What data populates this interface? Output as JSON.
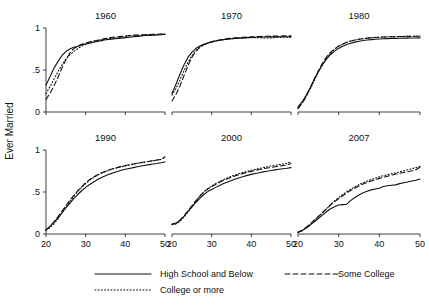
{
  "chart_data": {
    "type": "line",
    "title": "",
    "ylabel": "Ever Married",
    "xlabel": "",
    "xlim": [
      20,
      50
    ],
    "ylim": [
      0,
      1
    ],
    "yticks": [
      "0",
      ".5",
      "1"
    ],
    "ytick_values": [
      0,
      0.5,
      1
    ],
    "xticks": [
      "20",
      "30",
      "40",
      "50"
    ],
    "xtick_values": [
      20,
      30,
      40,
      50
    ],
    "grid": false,
    "legend_position": "bottom",
    "legend": [
      {
        "name": "High School and Below",
        "style": "solid"
      },
      {
        "name": "Some College",
        "style": "dashed"
      },
      {
        "name": "College or more",
        "style": "dotted"
      }
    ],
    "x": [
      20,
      21,
      22,
      23,
      24,
      25,
      26,
      27,
      28,
      29,
      30,
      31,
      32,
      33,
      34,
      35,
      36,
      37,
      38,
      39,
      40,
      41,
      42,
      43,
      44,
      45,
      46,
      47,
      48,
      49,
      50
    ],
    "panels": [
      {
        "title": "1960",
        "series": [
          {
            "name": "High School and Below",
            "style": "solid",
            "values": [
              0.32,
              0.42,
              0.52,
              0.6,
              0.67,
              0.72,
              0.75,
              0.77,
              0.78,
              0.8,
              0.81,
              0.82,
              0.83,
              0.84,
              0.85,
              0.86,
              0.865,
              0.87,
              0.875,
              0.88,
              0.885,
              0.89,
              0.895,
              0.9,
              0.905,
              0.91,
              0.912,
              0.915,
              0.918,
              0.92,
              0.925
            ]
          },
          {
            "name": "Some College",
            "style": "dashed",
            "values": [
              0.15,
              0.22,
              0.31,
              0.41,
              0.52,
              0.62,
              0.7,
              0.755,
              0.785,
              0.805,
              0.82,
              0.835,
              0.845,
              0.855,
              0.865,
              0.875,
              0.885,
              0.89,
              0.895,
              0.9,
              0.905,
              0.91,
              0.915,
              0.915,
              0.918,
              0.92,
              0.922,
              0.925,
              0.925,
              0.928,
              0.93
            ]
          },
          {
            "name": "College or more",
            "style": "dotted",
            "values": [
              0.22,
              0.3,
              0.39,
              0.48,
              0.56,
              0.63,
              0.68,
              0.72,
              0.755,
              0.785,
              0.805,
              0.825,
              0.84,
              0.85,
              0.86,
              0.87,
              0.875,
              0.88,
              0.885,
              0.89,
              0.9,
              0.905,
              0.905,
              0.91,
              0.912,
              0.915,
              0.918,
              0.92,
              0.922,
              0.925,
              0.928
            ]
          }
        ]
      },
      {
        "title": "1970",
        "series": [
          {
            "name": "High School and Below",
            "style": "solid",
            "values": [
              0.22,
              0.33,
              0.45,
              0.56,
              0.65,
              0.71,
              0.755,
              0.785,
              0.805,
              0.82,
              0.835,
              0.845,
              0.855,
              0.862,
              0.868,
              0.872,
              0.876,
              0.88,
              0.883,
              0.886,
              0.888,
              0.89,
              0.89,
              0.892,
              0.892,
              0.894,
              0.894,
              0.895,
              0.895,
              0.896,
              0.897
            ]
          },
          {
            "name": "Some College",
            "style": "dashed",
            "values": [
              0.13,
              0.21,
              0.31,
              0.43,
              0.55,
              0.65,
              0.72,
              0.77,
              0.8,
              0.82,
              0.835,
              0.848,
              0.858,
              0.866,
              0.873,
              0.878,
              0.882,
              0.886,
              0.889,
              0.892,
              0.895,
              0.897,
              0.899,
              0.9,
              0.902,
              0.903,
              0.904,
              0.905,
              0.906,
              0.906,
              0.907
            ]
          },
          {
            "name": "College or more",
            "style": "dotted",
            "values": [
              0.2,
              0.28,
              0.38,
              0.49,
              0.59,
              0.67,
              0.73,
              0.77,
              0.8,
              0.82,
              0.834,
              0.845,
              0.855,
              0.862,
              0.868,
              0.872,
              0.876,
              0.879,
              0.882,
              0.884,
              0.886,
              0.885,
              0.884,
              0.882,
              0.881,
              0.883,
              0.886,
              0.888,
              0.889,
              0.89,
              0.891
            ]
          }
        ]
      },
      {
        "title": "1980",
        "series": [
          {
            "name": "High School and Below",
            "style": "solid",
            "values": [
              0.06,
              0.12,
              0.2,
              0.29,
              0.39,
              0.48,
              0.56,
              0.63,
              0.685,
              0.725,
              0.757,
              0.782,
              0.803,
              0.819,
              0.832,
              0.842,
              0.851,
              0.857,
              0.862,
              0.866,
              0.869,
              0.872,
              0.874,
              0.876,
              0.877,
              0.878,
              0.879,
              0.88,
              0.881,
              0.881,
              0.882
            ]
          },
          {
            "name": "Some College",
            "style": "dashed",
            "values": [
              0.04,
              0.1,
              0.18,
              0.28,
              0.39,
              0.49,
              0.58,
              0.655,
              0.71,
              0.752,
              0.785,
              0.81,
              0.83,
              0.845,
              0.857,
              0.866,
              0.873,
              0.879,
              0.883,
              0.887,
              0.89,
              0.892,
              0.894,
              0.896,
              0.897,
              0.898,
              0.899,
              0.9,
              0.9,
              0.901,
              0.902
            ]
          },
          {
            "name": "College or more",
            "style": "dotted",
            "values": [
              0.05,
              0.11,
              0.185,
              0.275,
              0.375,
              0.475,
              0.565,
              0.64,
              0.7,
              0.745,
              0.78,
              0.807,
              0.828,
              0.844,
              0.856,
              0.866,
              0.873,
              0.879,
              0.884,
              0.888,
              0.891,
              0.893,
              0.895,
              0.897,
              0.898,
              0.899,
              0.9,
              0.901,
              0.902,
              0.902,
              0.903
            ]
          }
        ]
      },
      {
        "title": "1990",
        "series": [
          {
            "name": "High School and Below",
            "style": "solid",
            "values": [
              0.05,
              0.09,
              0.14,
              0.19,
              0.25,
              0.31,
              0.365,
              0.42,
              0.47,
              0.515,
              0.555,
              0.59,
              0.62,
              0.648,
              0.672,
              0.694,
              0.713,
              0.73,
              0.745,
              0.758,
              0.77,
              0.78,
              0.79,
              0.8,
              0.81,
              0.818,
              0.826,
              0.834,
              0.84,
              0.848,
              0.858
            ]
          },
          {
            "name": "Some College",
            "style": "dashed",
            "values": [
              0.05,
              0.09,
              0.145,
              0.205,
              0.27,
              0.335,
              0.4,
              0.46,
              0.515,
              0.565,
              0.61,
              0.648,
              0.68,
              0.706,
              0.728,
              0.748,
              0.765,
              0.78,
              0.793,
              0.805,
              0.815,
              0.825,
              0.834,
              0.843,
              0.851,
              0.859,
              0.866,
              0.873,
              0.88,
              0.888,
              0.92
            ]
          },
          {
            "name": "College or more",
            "style": "dotted",
            "values": [
              0.045,
              0.075,
              0.12,
              0.18,
              0.25,
              0.32,
              0.385,
              0.45,
              0.505,
              0.555,
              0.6,
              0.64,
              0.672,
              0.7,
              0.723,
              0.743,
              0.76,
              0.775,
              0.788,
              0.8,
              0.81,
              0.82,
              0.83,
              0.84,
              0.848,
              0.856,
              0.864,
              0.872,
              0.88,
              0.888,
              0.915
            ]
          }
        ]
      },
      {
        "title": "2000",
        "series": [
          {
            "name": "High School and Below",
            "style": "solid",
            "values": [
              0.12,
              0.13,
              0.165,
              0.21,
              0.265,
              0.32,
              0.375,
              0.425,
              0.47,
              0.505,
              0.53,
              0.555,
              0.578,
              0.6,
              0.62,
              0.638,
              0.655,
              0.67,
              0.685,
              0.698,
              0.71,
              0.72,
              0.73,
              0.74,
              0.748,
              0.756,
              0.763,
              0.77,
              0.776,
              0.782,
              0.79
            ]
          },
          {
            "name": "Some College",
            "style": "dashed",
            "values": [
              0.115,
              0.125,
              0.16,
              0.215,
              0.275,
              0.335,
              0.395,
              0.45,
              0.5,
              0.535,
              0.565,
              0.59,
              0.615,
              0.638,
              0.658,
              0.677,
              0.693,
              0.708,
              0.722,
              0.735,
              0.746,
              0.757,
              0.767,
              0.776,
              0.785,
              0.793,
              0.8,
              0.808,
              0.815,
              0.822,
              0.84
            ]
          },
          {
            "name": "College or more",
            "style": "dotted",
            "values": [
              0.11,
              0.12,
              0.15,
              0.2,
              0.26,
              0.325,
              0.39,
              0.45,
              0.5,
              0.54,
              0.572,
              0.6,
              0.625,
              0.648,
              0.668,
              0.687,
              0.704,
              0.72,
              0.734,
              0.747,
              0.759,
              0.77,
              0.78,
              0.79,
              0.8,
              0.81,
              0.818,
              0.826,
              0.834,
              0.842,
              0.862
            ]
          }
        ]
      },
      {
        "title": "2007",
        "series": [
          {
            "name": "High School and Below",
            "style": "solid",
            "values": [
              0.02,
              0.04,
              0.07,
              0.105,
              0.145,
              0.185,
              0.225,
              0.265,
              0.3,
              0.325,
              0.345,
              0.35,
              0.355,
              0.4,
              0.435,
              0.465,
              0.49,
              0.51,
              0.525,
              0.535,
              0.545,
              0.565,
              0.575,
              0.58,
              0.585,
              0.6,
              0.61,
              0.62,
              0.63,
              0.64,
              0.655
            ]
          },
          {
            "name": "Some College",
            "style": "dashed",
            "values": [
              0.02,
              0.045,
              0.08,
              0.12,
              0.165,
              0.21,
              0.255,
              0.3,
              0.345,
              0.385,
              0.42,
              0.455,
              0.49,
              0.52,
              0.548,
              0.572,
              0.595,
              0.615,
              0.632,
              0.648,
              0.662,
              0.675,
              0.688,
              0.7,
              0.712,
              0.722,
              0.732,
              0.742,
              0.752,
              0.765,
              0.795
            ]
          },
          {
            "name": "College or more",
            "style": "dotted",
            "values": [
              0.018,
              0.04,
              0.075,
              0.115,
              0.16,
              0.205,
              0.25,
              0.3,
              0.35,
              0.395,
              0.435,
              0.47,
              0.505,
              0.535,
              0.562,
              0.588,
              0.61,
              0.63,
              0.648,
              0.665,
              0.68,
              0.695,
              0.705,
              0.718,
              0.728,
              0.74,
              0.752,
              0.765,
              0.778,
              0.79,
              0.805
            ]
          }
        ]
      }
    ]
  }
}
